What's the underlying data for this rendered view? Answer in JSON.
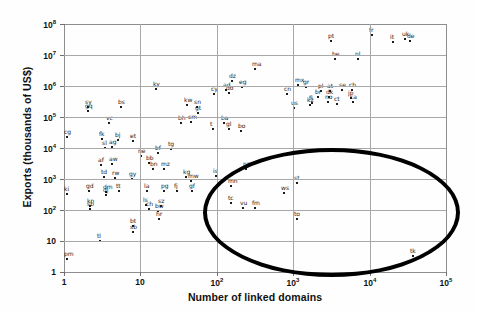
{
  "chart": {
    "type": "scatter",
    "title": "",
    "xlabel": "Number of linked domains",
    "ylabel": "Exports (thousands of US$)",
    "xscale": "log",
    "yscale": "log",
    "xlim": [
      1,
      100000
    ],
    "ylim": [
      1,
      100000000
    ],
    "grid": true,
    "legend": null,
    "xticks": [
      {
        "value": 1,
        "label": "1",
        "exp": ""
      },
      {
        "value": 10,
        "label": "10",
        "exp": ""
      },
      {
        "value": 100,
        "label": "10",
        "exp": "2"
      },
      {
        "value": 1000,
        "label": "10",
        "exp": "3"
      },
      {
        "value": 10000,
        "label": "10",
        "exp": "4"
      },
      {
        "value": 100000,
        "label": "10",
        "exp": "5"
      }
    ],
    "yticks": [
      {
        "value": 1,
        "label": "1",
        "exp": ""
      },
      {
        "value": 10,
        "label": "10",
        "exp": ""
      },
      {
        "value": 100,
        "label": "10",
        "exp": "2"
      },
      {
        "value": 1000,
        "label": "10",
        "exp": "3"
      },
      {
        "value": 10000,
        "label": "10",
        "exp": "4"
      },
      {
        "value": 100000,
        "label": "10",
        "exp": "5"
      },
      {
        "value": 1000000,
        "label": "10",
        "exp": "6"
      },
      {
        "value": 10000000,
        "label": "10",
        "exp": "7"
      },
      {
        "value": 100000000,
        "label": "10",
        "exp": "8"
      }
    ],
    "annotation": {
      "shape": "ellipse",
      "name": "outlier-highlight-ellipse",
      "color": "#000000",
      "center_x": 1500,
      "center_y": 700,
      "note": "Encircles small-island-economy outliers: tc, vu, fm, ws, st, to, tk"
    }
  },
  "chart_data": {
    "type": "scatter",
    "title": "",
    "xlabel": "Number of linked domains",
    "ylabel": "Exports (thousands of US$)",
    "xscale": "log",
    "yscale": "log",
    "xlim": [
      1,
      100000
    ],
    "ylim": [
      1,
      100000000
    ],
    "grid": true,
    "point_label_field": "label",
    "series": [
      {
        "name": "countries",
        "points": [
          {
            "label": "pm",
            "px": 66,
            "py": 258
          },
          {
            "label": "ki",
            "px": 66,
            "py": 193
          },
          {
            "label": "cg",
            "px": 66,
            "py": 136
          },
          {
            "label": "tl",
            "px": 99,
            "py": 240
          },
          {
            "label": "kn",
            "px": 89,
            "py": 205
          },
          {
            "label": "sb",
            "px": 89,
            "py": 208
          },
          {
            "label": "gd",
            "px": 88,
            "py": 190
          },
          {
            "label": "dm",
            "px": 105,
            "py": 191
          },
          {
            "label": "dj",
            "px": 105,
            "py": 194
          },
          {
            "label": "td",
            "px": 103,
            "py": 176
          },
          {
            "label": "rw",
            "px": 114,
            "py": 177
          },
          {
            "label": "af",
            "px": 100,
            "py": 164
          },
          {
            "label": "aw",
            "px": 111,
            "py": 163
          },
          {
            "label": "sl",
            "px": 104,
            "py": 147
          },
          {
            "label": "ag",
            "px": 111,
            "py": 146
          },
          {
            "label": "fk",
            "px": 101,
            "py": 138
          },
          {
            "label": "bj",
            "px": 117,
            "py": 139
          },
          {
            "label": "vc",
            "px": 108,
            "py": 122
          },
          {
            "label": "sy",
            "px": 87,
            "py": 106
          },
          {
            "label": "gq",
            "px": 87,
            "py": 110
          },
          {
            "label": "bs",
            "px": 120,
            "py": 106
          },
          {
            "label": "tt",
            "px": 118,
            "py": 190
          },
          {
            "label": "gy",
            "px": 131,
            "py": 178
          },
          {
            "label": "et",
            "px": 132,
            "py": 140
          },
          {
            "label": "bt",
            "px": 132,
            "py": 225
          },
          {
            "label": "sb2",
            "px": 132,
            "py": 231
          },
          {
            "label": "la",
            "px": 146,
            "py": 190
          },
          {
            "label": "ls",
            "px": 145,
            "py": 204
          },
          {
            "label": "ch2",
            "px": 148,
            "py": 208
          },
          {
            "label": "sz",
            "px": 160,
            "py": 205
          },
          {
            "label": "bw",
            "px": 157,
            "py": 210
          },
          {
            "label": "hr",
            "px": 158,
            "py": 218
          },
          {
            "label": "pg",
            "px": 163,
            "py": 190
          },
          {
            "label": "fj",
            "px": 176,
            "py": 190
          },
          {
            "label": "gf",
            "px": 191,
            "py": 190
          },
          {
            "label": "bb",
            "px": 148,
            "py": 162
          },
          {
            "label": "bn",
            "px": 152,
            "py": 168
          },
          {
            "label": "mz",
            "px": 163,
            "py": 168
          },
          {
            "label": "kg",
            "px": 185,
            "py": 176
          },
          {
            "label": "mw",
            "px": 190,
            "py": 180
          },
          {
            "label": "ne",
            "px": 140,
            "py": 155
          },
          {
            "label": "bf",
            "px": 157,
            "py": 152
          },
          {
            "label": "tg",
            "px": 170,
            "py": 148
          },
          {
            "label": "mn",
            "px": 230,
            "py": 185
          },
          {
            "label": "is",
            "px": 215,
            "py": 175
          },
          {
            "label": "nz",
            "px": 245,
            "py": 168
          },
          {
            "label": "ky",
            "px": 155,
            "py": 88
          },
          {
            "label": "kw",
            "px": 186,
            "py": 104
          },
          {
            "label": "sn",
            "px": 196,
            "py": 106
          },
          {
            "label": "gt",
            "px": 197,
            "py": 112
          },
          {
            "label": "bh",
            "px": 180,
            "py": 122
          },
          {
            "label": "cm",
            "px": 190,
            "py": 121
          },
          {
            "label": "ba",
            "px": 223,
            "py": 122
          },
          {
            "label": "t",
            "px": 212,
            "py": 128
          },
          {
            "label": "gl",
            "px": 228,
            "py": 128
          },
          {
            "label": "bo",
            "px": 240,
            "py": 130
          },
          {
            "label": "dz",
            "px": 231,
            "py": 80
          },
          {
            "label": "ad",
            "px": 225,
            "py": 89
          },
          {
            "label": "eg",
            "px": 241,
            "py": 86
          },
          {
            "label": "cy",
            "px": 213,
            "py": 93
          },
          {
            "label": "do",
            "px": 228,
            "py": 92
          },
          {
            "label": "ma",
            "px": 254,
            "py": 68
          },
          {
            "label": "cn",
            "px": 286,
            "py": 93
          },
          {
            "label": "mx",
            "px": 297,
            "py": 84
          },
          {
            "label": "gr",
            "px": 305,
            "py": 86
          },
          {
            "label": "pl",
            "px": 320,
            "py": 90
          },
          {
            "label": "at",
            "px": 329,
            "py": 90
          },
          {
            "label": "se",
            "px": 341,
            "py": 89
          },
          {
            "label": "ch",
            "px": 351,
            "py": 89
          },
          {
            "label": "br",
            "px": 317,
            "py": 96
          },
          {
            "label": "dk",
            "px": 328,
            "py": 96
          },
          {
            "label": "jp",
            "px": 350,
            "py": 97
          },
          {
            "label": "fi",
            "px": 311,
            "py": 102
          },
          {
            "label": "no",
            "px": 327,
            "py": 101
          },
          {
            "label": "ca",
            "px": 352,
            "py": 101
          },
          {
            "label": "ct",
            "px": 336,
            "py": 103
          },
          {
            "label": "kz",
            "px": 309,
            "py": 104
          },
          {
            "label": "us",
            "px": 293,
            "py": 107
          },
          {
            "label": "pt",
            "px": 330,
            "py": 40
          },
          {
            "label": "be",
            "px": 334,
            "py": 58
          },
          {
            "label": "nl",
            "px": 357,
            "py": 58
          },
          {
            "label": "fr",
            "px": 371,
            "py": 34
          },
          {
            "label": "it",
            "px": 392,
            "py": 41
          },
          {
            "label": "uk",
            "px": 404,
            "py": 38
          },
          {
            "label": "de",
            "px": 409,
            "py": 40
          },
          {
            "label": "tc",
            "px": 230,
            "py": 202
          },
          {
            "label": "vu",
            "px": 242,
            "py": 207
          },
          {
            "label": "fm",
            "px": 254,
            "py": 207
          },
          {
            "label": "ws",
            "px": 283,
            "py": 192
          },
          {
            "label": "st",
            "px": 296,
            "py": 182
          },
          {
            "label": "to",
            "px": 296,
            "py": 218
          },
          {
            "label": "tk",
            "px": 412,
            "py": 255
          }
        ]
      }
    ],
    "highlighted_group": {
      "name": "encircled-outliers",
      "labels": [
        "tc",
        "vu",
        "fm",
        "ws",
        "st",
        "to",
        "tk"
      ],
      "shape": "ellipse"
    }
  }
}
